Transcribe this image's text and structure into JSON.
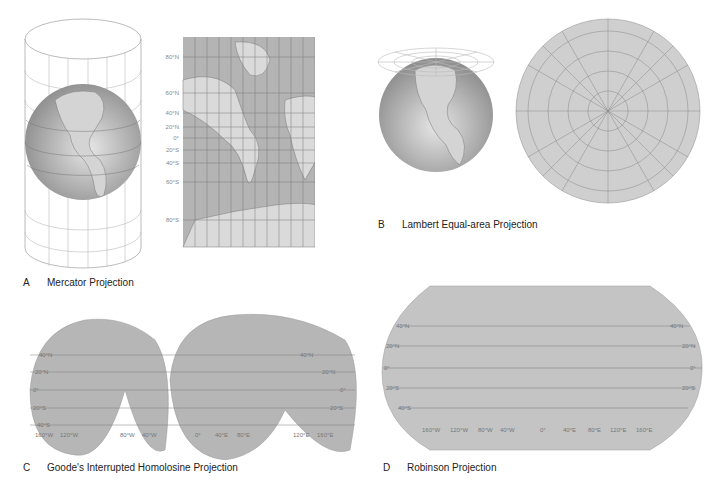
{
  "colors": {
    "ocean": "#a9a9a9",
    "land": "#d8d8d8",
    "grid": "#7a7a7a",
    "label": "#8a8a8a",
    "caption": "#222222"
  },
  "panels": [
    {
      "id": "A",
      "letter": "A",
      "title": "Mercator Projection",
      "lat_labels": [
        "80°N",
        "60°N",
        "40°N",
        "20°N",
        "0°",
        "20°S",
        "40°S",
        "60°S",
        "80°S"
      ]
    },
    {
      "id": "B",
      "letter": "B",
      "title": "Lambert Equal-area Projection",
      "lon_labels": [
        "120°E",
        "100°E",
        "80°E",
        "60°E",
        "40°E",
        "20°E",
        "0°",
        "140°E",
        "160°E",
        "180°",
        "160°W",
        "140°W",
        "120°W",
        "100°W",
        "80°W",
        "60°W",
        "40°W",
        "20°W"
      ]
    },
    {
      "id": "C",
      "letter": "C",
      "title": "Goode's Interrupted Homolosine Projection",
      "lat_labels_left": [
        "40°N",
        "20°N",
        "0°",
        "20°S",
        "40°S"
      ],
      "lat_labels_right": [
        "40°N",
        "20°N",
        "0°",
        "20°S"
      ],
      "lon_labels": [
        "160°W",
        "120°W",
        "80°W",
        "40°W",
        "0°",
        "40°E",
        "80°E",
        "120°E",
        "160°E"
      ]
    },
    {
      "id": "D",
      "letter": "D",
      "title": "Robinson Projection",
      "lat_labels_left": [
        "40°N",
        "20°N",
        "0°",
        "20°S",
        "40°S"
      ],
      "lat_labels_right": [
        "40°N",
        "20°N",
        "0°",
        "20°S"
      ],
      "lon_labels": [
        "160°W",
        "120°W",
        "80°W",
        "40°W",
        "0°",
        "40°E",
        "80°E",
        "120°E",
        "160°E"
      ]
    }
  ]
}
